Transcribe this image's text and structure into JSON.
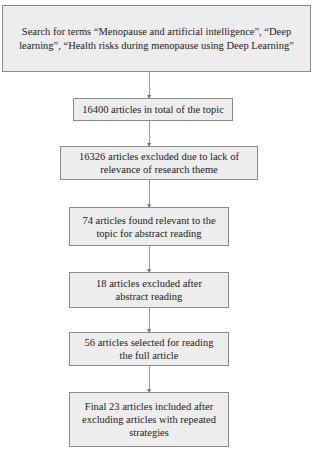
{
  "flowchart": {
    "steps": [
      {
        "id": "search",
        "text": "Search for terms “Menopause and artificial intelligence”, “Deep learning”, “Health risks during menopause using Deep Learning”"
      },
      {
        "id": "total",
        "text": "16400 articles in total of the topic"
      },
      {
        "id": "excluded-relevance",
        "text": "16326 articles excluded due to lack of relevance of research theme"
      },
      {
        "id": "relevant",
        "text": "74 articles found relevant to the topic for abstract reading"
      },
      {
        "id": "excluded-abstract",
        "text": "18 articles excluded after abstract reading"
      },
      {
        "id": "selected-full",
        "text": "56 articles selected for reading the full article"
      },
      {
        "id": "final",
        "text": "Final 23 articles included after excluding articles with repeated strategies"
      }
    ],
    "colors": {
      "box_fill": "#ededed",
      "box_border": "#8a8a8a",
      "arrow": "#9a9a9a"
    }
  }
}
